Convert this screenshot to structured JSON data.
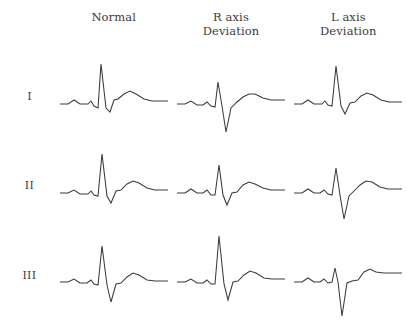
{
  "figure": {
    "stroke_color": "#3a3a3a",
    "text_color": "#3b3b3b",
    "background_color": "#ffffff"
  },
  "columns": [
    {
      "id": "normal",
      "line1": "Normal",
      "line2": ""
    },
    {
      "id": "r-axis-deviation",
      "line1": "R axis",
      "line2": "Deviation"
    },
    {
      "id": "l-axis-deviation",
      "line1": "L axis",
      "line2": "Deviation"
    }
  ],
  "rows": [
    {
      "id": "lead-1",
      "label": "I"
    },
    {
      "id": "lead-2",
      "label": "II"
    },
    {
      "id": "lead-3",
      "label": "III"
    }
  ],
  "chart_data": {
    "type": "line",
    "xlabel": "",
    "ylabel": "",
    "grid": false,
    "legend_position": "none",
    "viewbox": {
      "width": 112,
      "height": 86
    },
    "note": "Each trace is a polyline of x,y points in a 112x86 viewbox; y increases downward, baseline at y=50.",
    "baseline_y": 50,
    "traces": [
      {
        "row": "I",
        "column": "Normal",
        "morphology": "tall positive R wave, small q, small s, upright P and T",
        "points": "2,50 10,50 16,46 22,50 30,50 33,47 36,52 40,54 43,10 48,54 52,58 56,46 60,45 66,40 72,37 78,40 86,45 94,47 110,47"
      },
      {
        "row": "I",
        "column": "R axis Deviation",
        "morphology": "predominantly negative QRS with deep S wave",
        "points": "2,50 10,50 16,47 22,51 28,51 32,48 36,52 40,53 43,28 47,52 51,78 56,54 62,48 68,43 74,40 80,40 88,44 96,46 110,46"
      },
      {
        "row": "I",
        "column": "L axis Deviation",
        "morphology": "tall positive R wave, dominant upright QRS",
        "points": "2,50 10,50 16,46 22,50 30,50 33,47 36,51 40,52 44,12 49,52 53,60 58,49 63,48 69,42 75,39 81,41 89,46 97,48 110,48"
      },
      {
        "row": "II",
        "column": "Normal",
        "morphology": "tall positive R wave, upright P and T",
        "points": "2,50 10,50 16,47 22,51 30,51 33,48 36,52 40,53 44,11 49,53 53,60 58,48 63,47 69,41 75,38 81,40 89,45 97,47 110,47"
      },
      {
        "row": "II",
        "column": "R axis Deviation",
        "morphology": "moderate positive R wave with small S wave",
        "points": "2,50 10,50 16,46 22,50 28,50 32,47 36,52 40,52 44,22 48,52 52,62 57,50 62,49 68,42 74,39 80,41 88,45 96,47 110,47"
      },
      {
        "row": "II",
        "column": "L axis Deviation",
        "morphology": "predominantly negative QRS with deep S wave",
        "points": "2,50 10,50 16,46 22,50 28,50 32,47 36,51 40,52 44,25 48,52 52,76 57,53 62,48 68,42 74,38 80,39 88,44 96,46 110,46"
      },
      {
        "row": "III",
        "column": "Normal",
        "morphology": "positive R wave with notable S wave",
        "points": "2,50 10,50 16,47 22,51 29,51 33,48 36,52 40,53 44,14 49,53 53,70 58,52 63,51 69,45 75,41 81,43 89,48 97,49 110,49"
      },
      {
        "row": "III",
        "column": "R axis Deviation",
        "morphology": "very tall R wave, dominant upright QRS",
        "points": "2,50 10,50 16,47 22,51 28,51 32,48 36,52 40,52 44,4 49,52 53,68 58,50 63,49 69,43 75,39 81,41 89,46 97,47 110,47"
      },
      {
        "row": "III",
        "column": "L axis Deviation",
        "morphology": "deeply negative QRS with very small R wave",
        "points": "2,50 10,50 16,46 22,50 28,50 32,47 36,51 40,50 43,36 46,50 50,84 55,51 60,49 66,48 72,40 78,37 84,40 92,41 110,41"
      }
    ]
  }
}
